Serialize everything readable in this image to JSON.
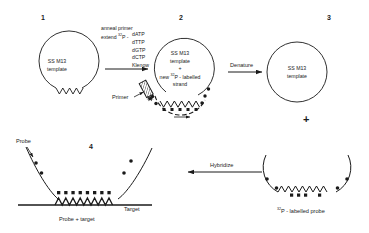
{
  "figure": {
    "background_color": "#ffffff",
    "ink_color": "#1a1a1a"
  },
  "panels": [
    {
      "number": "1",
      "inner_line1": "SS M13",
      "inner_line2": "template"
    },
    {
      "number": "2",
      "inner_line1": "SS M13",
      "inner_line2": "template",
      "inner_line3": "+",
      "inner_line4_pre": "new ",
      "inner_line4_sup": "32",
      "inner_line4_post": "P - labelled",
      "inner_line5": "strand",
      "primer_label": "Primer"
    },
    {
      "number": "3",
      "inner_line1": "SS M13",
      "inner_line2": "template"
    },
    {
      "number": "4",
      "probe_label": "Probe",
      "target_label": "Target",
      "caption": "Probe + target"
    }
  ],
  "reactions": {
    "step1_line1": "anneal primer",
    "step1_line2_pre": "extend ",
    "step1_line2_sup": "32",
    "step1_line2_post": "P -",
    "nucleotides": [
      "dATP",
      "dTTP",
      "dGTP",
      "dCTP",
      "Klenow"
    ],
    "denature_label": "Denature",
    "hybridize_label": "Hybridize"
  },
  "probe_product": {
    "plus_sign": "+",
    "caption_sup": "32",
    "caption_text": "P - labelled probe"
  }
}
